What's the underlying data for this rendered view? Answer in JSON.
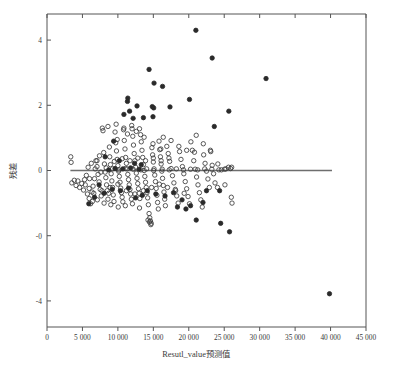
{
  "chart_data": {
    "type": "scatter",
    "title": "",
    "xlabel": "Resutl_value预测值",
    "ylabel": "残差",
    "xlim": [
      0,
      45000
    ],
    "ylim": [
      -4.8,
      4.8
    ],
    "grid": false,
    "legend": null,
    "x_ticks": [
      0,
      5000,
      10000,
      15000,
      20000,
      25000,
      30000,
      35000,
      40000,
      45000
    ],
    "x_tick_labels": [
      "0",
      "5 000",
      "10 000",
      "15 000",
      "20 000",
      "25 000",
      "30 000",
      "35 000",
      "40 000",
      "45 000"
    ],
    "y_ticks": [
      4,
      2,
      0,
      -2,
      -4
    ],
    "y_tick_labels": [
      "4",
      "2",
      "0",
      "-0",
      "-4"
    ],
    "reference_line": {
      "y": 0,
      "x_start": 3300,
      "x_end": 40200,
      "color": "#6e6e6e"
    },
    "marker_styles": {
      "open": {
        "fill": "none",
        "stroke": "#3b3b3b",
        "radius": 2.2
      },
      "filled": {
        "fill": "#2a2a2a",
        "stroke": "#2a2a2a",
        "radius": 2.2
      }
    },
    "series": [
      {
        "name": "residuals-open",
        "style": "open",
        "points": [
          [
            3350,
            0.42
          ],
          [
            3400,
            0.25
          ],
          [
            3500,
            -0.38
          ],
          [
            3850,
            -0.3
          ],
          [
            4100,
            -0.46
          ],
          [
            4350,
            -0.32
          ],
          [
            4600,
            -0.52
          ],
          [
            4900,
            -0.4
          ],
          [
            5150,
            -0.6
          ],
          [
            5300,
            -0.28
          ],
          [
            5550,
            -0.15
          ],
          [
            5700,
            -0.72
          ],
          [
            5950,
            -0.55
          ],
          [
            6150,
            -1.02
          ],
          [
            6350,
            -0.66
          ],
          [
            6500,
            -0.48
          ],
          [
            6700,
            -0.25
          ],
          [
            6900,
            0.3
          ],
          [
            7050,
            0.12
          ],
          [
            7200,
            -0.12
          ],
          [
            7350,
            -0.35
          ],
          [
            7500,
            -0.58
          ],
          [
            7650,
            -0.78
          ],
          [
            7800,
            1.3
          ],
          [
            7900,
            1.22
          ],
          [
            8000,
            0.55
          ],
          [
            8100,
            0.2
          ],
          [
            8200,
            -0.05
          ],
          [
            8300,
            -0.22
          ],
          [
            8400,
            -0.44
          ],
          [
            8500,
            -0.62
          ],
          [
            8600,
            -0.88
          ],
          [
            8700,
            -0.7
          ],
          [
            8850,
            0.42
          ],
          [
            8950,
            0.18
          ],
          [
            9050,
            -0.1
          ],
          [
            9150,
            -0.32
          ],
          [
            9250,
            -0.52
          ],
          [
            9350,
            -0.75
          ],
          [
            9450,
            -0.95
          ],
          [
            9600,
            1.18
          ],
          [
            9700,
            0.85
          ],
          [
            9800,
            0.6
          ],
          [
            9900,
            0.34
          ],
          [
            10000,
            0.15
          ],
          [
            10100,
            -0.02
          ],
          [
            10200,
            -0.18
          ],
          [
            10300,
            -0.36
          ],
          [
            10400,
            -0.54
          ],
          [
            10500,
            -0.68
          ],
          [
            10600,
            -0.82
          ],
          [
            10700,
            -0.96
          ],
          [
            10800,
            1.25
          ],
          [
            10900,
            0.92
          ],
          [
            11000,
            0.66
          ],
          [
            11100,
            0.4
          ],
          [
            11200,
            0.22
          ],
          [
            11300,
            0.05
          ],
          [
            11400,
            -0.12
          ],
          [
            11500,
            -0.28
          ],
          [
            11600,
            -0.44
          ],
          [
            11700,
            -0.58
          ],
          [
            11800,
            -0.72
          ],
          [
            11900,
            -0.88
          ],
          [
            12000,
            1.28
          ],
          [
            12100,
            1.05
          ],
          [
            12200,
            0.78
          ],
          [
            12300,
            0.52
          ],
          [
            12400,
            0.3
          ],
          [
            12500,
            0.1
          ],
          [
            12600,
            -0.08
          ],
          [
            12700,
            -0.24
          ],
          [
            12800,
            -0.4
          ],
          [
            12900,
            -0.56
          ],
          [
            13000,
            -0.7
          ],
          [
            13100,
            -0.86
          ],
          [
            13200,
            1.1
          ],
          [
            13300,
            0.88
          ],
          [
            13400,
            0.62
          ],
          [
            13500,
            0.4
          ],
          [
            13600,
            0.18
          ],
          [
            13700,
            0.0
          ],
          [
            13800,
            -0.18
          ],
          [
            13900,
            -0.36
          ],
          [
            14000,
            -0.52
          ],
          [
            14100,
            -0.68
          ],
          [
            14200,
            -0.84
          ],
          [
            14300,
            -1.05
          ],
          [
            14400,
            -1.32
          ],
          [
            14500,
            -1.45
          ],
          [
            14600,
            -1.55
          ],
          [
            14700,
            -1.62
          ],
          [
            14800,
            0.7
          ],
          [
            14900,
            0.48
          ],
          [
            15000,
            0.26
          ],
          [
            15100,
            0.05
          ],
          [
            15200,
            -0.14
          ],
          [
            15300,
            -0.34
          ],
          [
            15400,
            -0.55
          ],
          [
            15500,
            -0.76
          ],
          [
            15600,
            -0.98
          ],
          [
            15700,
            -1.18
          ],
          [
            15800,
            0.9
          ],
          [
            15900,
            0.64
          ],
          [
            16000,
            0.42
          ],
          [
            16100,
            0.2
          ],
          [
            16200,
            -0.02
          ],
          [
            16300,
            -0.24
          ],
          [
            16400,
            -0.46
          ],
          [
            16500,
            -0.66
          ],
          [
            16600,
            -0.88
          ],
          [
            16700,
            -1.08
          ],
          [
            16900,
            0.74
          ],
          [
            17100,
            0.52
          ],
          [
            17300,
            0.28
          ],
          [
            17500,
            0.06
          ],
          [
            17700,
            -0.16
          ],
          [
            17900,
            -0.38
          ],
          [
            18100,
            -0.58
          ],
          [
            18300,
            -0.78
          ],
          [
            18500,
            -1.0
          ],
          [
            18700,
            0.58
          ],
          [
            18900,
            0.34
          ],
          [
            19100,
            0.12
          ],
          [
            19300,
            -0.1
          ],
          [
            19500,
            -0.34
          ],
          [
            19700,
            -0.56
          ],
          [
            19900,
            -0.8
          ],
          [
            20100,
            -1.02
          ],
          [
            20300,
            0.88
          ],
          [
            20500,
            0.62
          ],
          [
            20700,
            0.3
          ],
          [
            20900,
            0.04
          ],
          [
            21100,
            -0.2
          ],
          [
            21300,
            -0.44
          ],
          [
            21500,
            -0.68
          ],
          [
            21700,
            -0.9
          ],
          [
            21900,
            -1.12
          ],
          [
            22100,
            0.48
          ],
          [
            22300,
            0.22
          ],
          [
            22500,
            -0.02
          ],
          [
            22700,
            -0.26
          ],
          [
            22900,
            -0.52
          ],
          [
            23100,
            0.58
          ],
          [
            23300,
            0.16
          ],
          [
            23500,
            -0.1
          ],
          [
            23700,
            -0.38
          ],
          [
            24100,
            0.2
          ],
          [
            24600,
            0.02
          ],
          [
            25100,
            -0.44
          ],
          [
            25600,
            0.1
          ],
          [
            25900,
            0.06
          ],
          [
            26000,
            -0.82
          ],
          [
            26100,
            -1.0
          ],
          [
            6000,
            -0.25
          ],
          [
            7100,
            -0.9
          ],
          [
            8050,
            -1.0
          ],
          [
            9000,
            -1.05
          ],
          [
            10050,
            -1.12
          ],
          [
            11050,
            -1.08
          ],
          [
            12050,
            -1.02
          ],
          [
            13050,
            -1.15
          ],
          [
            7400,
            0.45
          ],
          [
            8800,
            0.72
          ],
          [
            9900,
            0.95
          ],
          [
            11350,
            1.12
          ],
          [
            12600,
            1.2
          ],
          [
            13700,
            1.02
          ],
          [
            14950,
            0.82
          ],
          [
            16050,
            0.66
          ],
          [
            6800,
            0.05
          ],
          [
            7600,
            -0.05
          ],
          [
            8350,
            0.08
          ],
          [
            9250,
            0.05
          ],
          [
            10150,
            0.02
          ],
          [
            11050,
            0.06
          ],
          [
            12150,
            0.04
          ],
          [
            13250,
            0.02
          ],
          [
            14050,
            0.05
          ],
          [
            15050,
            0.0
          ],
          [
            16250,
            0.04
          ],
          [
            17250,
            0.02
          ],
          [
            18250,
            0.05
          ],
          [
            19250,
            0.02
          ],
          [
            20250,
            0.04
          ],
          [
            21250,
            0.02
          ],
          [
            22250,
            0.05
          ],
          [
            23250,
            0.04
          ],
          [
            24250,
            0.02
          ],
          [
            25250,
            0.05
          ],
          [
            6250,
            0.22
          ],
          [
            7050,
            0.3
          ],
          [
            5800,
            0.1
          ],
          [
            6600,
            -0.7
          ],
          [
            7750,
            -0.62
          ],
          [
            8900,
            -0.52
          ],
          [
            10000,
            -0.42
          ],
          [
            11200,
            -0.62
          ],
          [
            12400,
            -0.72
          ],
          [
            13600,
            -0.62
          ],
          [
            14750,
            -0.52
          ],
          [
            15850,
            -0.42
          ],
          [
            17000,
            -0.52
          ],
          [
            18150,
            -0.62
          ],
          [
            19350,
            -0.7
          ],
          [
            9500,
            0.28
          ],
          [
            10600,
            0.36
          ],
          [
            11700,
            0.3
          ],
          [
            12800,
            0.38
          ],
          [
            13900,
            0.3
          ],
          [
            15000,
            0.38
          ],
          [
            16100,
            0.3
          ],
          [
            17200,
            0.38
          ],
          [
            5400,
            -0.44
          ],
          [
            5950,
            -0.86
          ],
          [
            6400,
            -0.95
          ],
          [
            14250,
            -1.52
          ],
          [
            14450,
            -1.58
          ],
          [
            14650,
            -1.66
          ],
          [
            21050,
            1.08
          ],
          [
            22050,
            0.82
          ],
          [
            23050,
            0.62
          ],
          [
            24050,
            -0.52
          ],
          [
            25050,
            0.04
          ],
          [
            26050,
            0.1
          ],
          [
            8600,
            1.35
          ],
          [
            9750,
            1.42
          ],
          [
            10850,
            1.3
          ],
          [
            11950,
            1.38
          ],
          [
            13050,
            1.28
          ],
          [
            16400,
            1.02
          ],
          [
            17500,
            0.92
          ],
          [
            18600,
            0.74
          ],
          [
            19700,
            0.62
          ],
          [
            20800,
            0.56
          ]
        ]
      },
      {
        "name": "residuals-filled-outliers",
        "style": "filled",
        "points": [
          [
            21000,
            4.3
          ],
          [
            23300,
            3.45
          ],
          [
            30900,
            2.82
          ],
          [
            14400,
            3.1
          ],
          [
            15100,
            2.68
          ],
          [
            16300,
            2.58
          ],
          [
            20100,
            2.18
          ],
          [
            11400,
            2.22
          ],
          [
            11350,
            2.12
          ],
          [
            12700,
            1.98
          ],
          [
            14850,
            1.96
          ],
          [
            15050,
            1.92
          ],
          [
            17350,
            1.95
          ],
          [
            25650,
            1.82
          ],
          [
            10850,
            1.72
          ],
          [
            11650,
            1.82
          ],
          [
            12150,
            1.6
          ],
          [
            13600,
            1.62
          ],
          [
            14950,
            1.65
          ],
          [
            23600,
            1.35
          ],
          [
            9400,
            0.9
          ],
          [
            8200,
            0.42
          ],
          [
            10200,
            0.3
          ],
          [
            12350,
            0.22
          ],
          [
            13300,
            0.18
          ],
          [
            24350,
            -0.62
          ],
          [
            24500,
            -1.62
          ],
          [
            25750,
            -1.88
          ],
          [
            22500,
            -0.62
          ],
          [
            21050,
            -1.52
          ],
          [
            39850,
            -3.78
          ],
          [
            5900,
            -1.02
          ],
          [
            6700,
            -0.82
          ],
          [
            8050,
            -0.7
          ],
          [
            12500,
            -0.84
          ],
          [
            13450,
            -0.76
          ],
          [
            16650,
            -0.78
          ],
          [
            17850,
            -0.68
          ],
          [
            19050,
            -0.9
          ],
          [
            20250,
            -1.08
          ],
          [
            9200,
            -0.58
          ],
          [
            10350,
            -0.62
          ],
          [
            11500,
            -0.54
          ],
          [
            7350,
            -0.44
          ],
          [
            14150,
            -0.62
          ],
          [
            15350,
            -0.72
          ],
          [
            18400,
            -1.12
          ],
          [
            19600,
            -1.18
          ],
          [
            22000,
            -0.98
          ],
          [
            13000,
            0.04
          ],
          [
            11800,
            0.08
          ],
          [
            10700,
            0.05
          ],
          [
            9600,
            0.06
          ],
          [
            8700,
            0.02
          ]
        ]
      }
    ]
  },
  "axis": {
    "x_title": "Resutl_value预测值",
    "y_title": "残差"
  }
}
